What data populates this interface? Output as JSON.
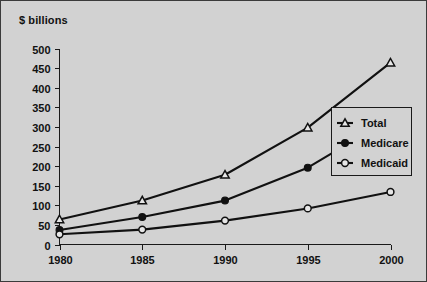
{
  "figure": {
    "background_color": "#d2d2d2",
    "border_color": "#3b3b3b",
    "axis_title": "$ billions"
  },
  "chart_data": {
    "type": "line",
    "title": "",
    "subtitle": "",
    "xlabel": "",
    "ylabel": "$ billions",
    "categories": [
      "1980",
      "1985",
      "1990",
      "1995",
      "2000"
    ],
    "x": [
      1980,
      1985,
      1990,
      1995,
      2000
    ],
    "xlim": [
      1980,
      2000
    ],
    "ylim": [
      0,
      500
    ],
    "ytick_labels": [
      "0",
      "50",
      "100",
      "150",
      "200",
      "250",
      "300",
      "350",
      "400",
      "450",
      "500"
    ],
    "yticks": [
      0,
      50,
      100,
      150,
      200,
      250,
      300,
      350,
      400,
      450,
      500
    ],
    "xtick_labels": [
      "1980",
      "1985",
      "1990",
      "1995",
      "2000"
    ],
    "grid": false,
    "legend_position": "center right",
    "series": [
      {
        "name": "Total",
        "marker": "open-triangle",
        "color": "#111111",
        "values": [
          64,
          112,
          178,
          298,
          464
        ]
      },
      {
        "name": "Medicare",
        "marker": "filled-circle",
        "color": "#111111",
        "values": [
          37,
          70,
          112,
          196,
          322
        ]
      },
      {
        "name": "Medicaid",
        "marker": "open-circle",
        "color": "#111111",
        "values": [
          26,
          38,
          61,
          92,
          134
        ]
      }
    ],
    "legend": [
      {
        "label": "Total",
        "marker": "open-triangle"
      },
      {
        "label": "Medicare",
        "marker": "filled-circle"
      },
      {
        "label": "Medicaid",
        "marker": "open-circle"
      }
    ]
  }
}
